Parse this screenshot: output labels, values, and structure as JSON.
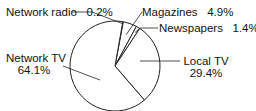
{
  "chart_data": {
    "type": "pie",
    "title": "",
    "categories": [
      "Network radio",
      "Magazines",
      "Newspapers",
      "Local TV",
      "Network TV"
    ],
    "values": [
      0.2,
      4.9,
      1.4,
      29.4,
      64.1
    ],
    "unit": "%",
    "labels": [
      {
        "name": "Network radio",
        "value": "0.2%"
      },
      {
        "name": "Magazines",
        "value": "4.9%"
      },
      {
        "name": "Newspapers",
        "value": "1.4%"
      },
      {
        "name": "Local TV",
        "value": "29.4%"
      },
      {
        "name": "Network TV",
        "value": "64.1%"
      }
    ],
    "legend": "none (callout labels)",
    "colors": {
      "fill": "#ffffff",
      "stroke": "#222222"
    }
  }
}
